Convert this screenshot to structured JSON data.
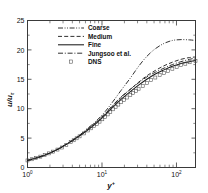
{
  "figure": {
    "background_color": "#ffffff",
    "line_color": "#1a1a1a",
    "axis_color": "#3a3a3a",
    "marker_color": "#4a4a4a"
  },
  "axes": {
    "x": {
      "label_base": "y",
      "label_sup": "+",
      "scale": "log",
      "range": [
        1,
        180
      ],
      "tick_labels": [
        "10",
        "10",
        "10"
      ],
      "tick_sups": [
        "0",
        "1",
        "2"
      ],
      "tick_values": [
        1,
        10,
        100
      ]
    },
    "y": {
      "label_base": "u/u",
      "label_sub": "τ",
      "scale": "linear",
      "range": [
        0,
        25
      ],
      "tick_labels": [
        "0",
        "5",
        "10",
        "15",
        "20",
        "25"
      ],
      "tick_values": [
        0,
        5,
        10,
        15,
        20,
        25
      ]
    }
  },
  "legend": {
    "position": "top-left-inside",
    "entries": [
      {
        "label": "Coarse",
        "style": "dash-dot-dot",
        "marker": "none"
      },
      {
        "label": "Medium",
        "style": "dashed",
        "marker": "none"
      },
      {
        "label": "Fine",
        "style": "solid",
        "marker": "none"
      },
      {
        "label": "Jungsoo et al.",
        "style": "dash-dot",
        "marker": "none"
      },
      {
        "label": "DNS",
        "style": "none",
        "marker": "open-square"
      }
    ]
  },
  "chart_data": {
    "type": "line",
    "title": "",
    "xlabel": "y+",
    "ylabel": "u/u_tau",
    "xscale": "log",
    "xlim": [
      1,
      180
    ],
    "ylim": [
      0,
      25
    ],
    "grid": false,
    "legend_position": "upper left",
    "x": [
      1,
      1.3,
      1.7,
      2.2,
      2.9,
      3.8,
      5,
      6.5,
      8.5,
      11,
      14,
      18,
      24,
      31,
      40,
      52,
      68,
      88,
      115,
      150,
      180
    ],
    "series": [
      {
        "name": "Coarse",
        "style": "dash-dot-dot",
        "values": [
          1.2,
          1.6,
          2.1,
          2.7,
          3.5,
          4.4,
          5.5,
          6.7,
          8.0,
          9.5,
          11.2,
          13.1,
          15.2,
          17.2,
          18.9,
          20.2,
          21.1,
          21.6,
          21.75,
          21.7,
          21.6
        ]
      },
      {
        "name": "Medium",
        "style": "dashed",
        "values": [
          1.2,
          1.6,
          2.1,
          2.7,
          3.5,
          4.4,
          5.4,
          6.5,
          7.7,
          9.1,
          10.5,
          11.9,
          13.3,
          14.5,
          15.6,
          16.5,
          17.3,
          17.9,
          18.4,
          18.7,
          18.8
        ]
      },
      {
        "name": "Fine",
        "style": "solid",
        "values": [
          1.2,
          1.6,
          2.1,
          2.7,
          3.5,
          4.4,
          5.4,
          6.4,
          7.6,
          8.9,
          10.3,
          11.6,
          12.9,
          14.0,
          15.0,
          15.9,
          16.6,
          17.2,
          17.7,
          18.0,
          18.2
        ]
      },
      {
        "name": "Jungsoo et al.",
        "style": "dash-dot",
        "values": [
          1.2,
          1.6,
          2.1,
          2.7,
          3.5,
          4.4,
          5.45,
          6.55,
          7.8,
          9.2,
          10.6,
          12.0,
          13.3,
          14.4,
          15.4,
          16.2,
          16.9,
          17.5,
          18.0,
          18.4,
          18.6
        ]
      },
      {
        "name": "DNS",
        "style": "markers",
        "marker": "open-square",
        "values": [
          1.2,
          1.6,
          2.1,
          2.7,
          3.4,
          4.3,
          5.3,
          6.3,
          7.4,
          8.6,
          9.9,
          11.1,
          12.3,
          13.4,
          14.4,
          15.3,
          16.1,
          16.8,
          17.4,
          17.9,
          18.1
        ]
      }
    ]
  }
}
